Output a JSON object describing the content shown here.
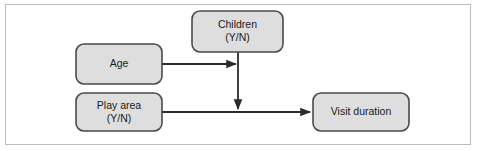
{
  "figure": {
    "type": "path-diagram",
    "background_color": "#ffffff",
    "frame_border_color": "#b9bcbe",
    "node_fill_color": "#dedede",
    "node_border_color": "#4a4a4a",
    "edge_color": "#2b2b2b"
  },
  "nodes": [
    {
      "id": "children",
      "label_line1": "Children",
      "label_line2": "(Y/N)",
      "x": 192,
      "y": 11,
      "width": 91,
      "height": 41
    },
    {
      "id": "age",
      "label_line1": "Age",
      "label_line2": "",
      "x": 76,
      "y": 44,
      "width": 86,
      "height": 40
    },
    {
      "id": "play-area",
      "label_line1": "Play area",
      "label_line2": "(Y/N)",
      "x": 76,
      "y": 93,
      "width": 86,
      "height": 38
    },
    {
      "id": "visit-duration",
      "label_line1": "Visit duration",
      "label_line2": "",
      "x": 313,
      "y": 93,
      "width": 96,
      "height": 38
    }
  ],
  "edges": [
    {
      "id": "age-to-junction",
      "from": "age",
      "to": "children-path",
      "path": "M 162 64 L 236 64",
      "arrowhead": true
    },
    {
      "id": "children-to-visit-duration",
      "from": "children",
      "to": "play-area-path",
      "path": "M 238 52 L 238 109",
      "arrowhead": true
    },
    {
      "id": "play-area-to-visit-duration",
      "from": "play-area",
      "to": "visit-duration",
      "path": "M 162 112 L 310 112",
      "arrowhead": true
    }
  ]
}
